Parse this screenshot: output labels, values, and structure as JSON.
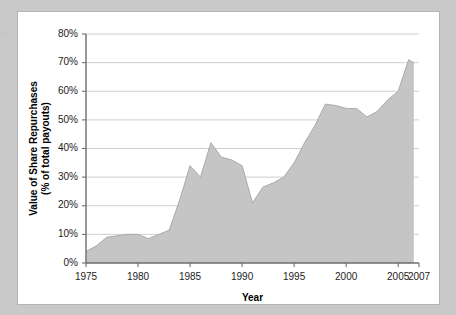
{
  "figure": {
    "background_color": "#c9c9c9",
    "panel_color": "#ffffff",
    "panel_border_color": "#b4b4b4",
    "edge_artifact_text": "s"
  },
  "chart_data": {
    "type": "area",
    "title": "",
    "xlabel": "Year",
    "ylabel": "Value of Share Repurchases\n(% of total payouts)",
    "ylabel_line1": "Value of Share Repurchases",
    "ylabel_line2": "(% of total payouts)",
    "xlim": [
      1975,
      2007
    ],
    "ylim": [
      0,
      80
    ],
    "grid": "horizontal",
    "legend": "none",
    "series_color": "#c5c5c5",
    "series_edge_color": "#a9a9a9",
    "y_tick_labels": [
      "0%",
      "10%",
      "20%",
      "30%",
      "40%",
      "50%",
      "60%",
      "70%",
      "80%"
    ],
    "y_tick_values": [
      0,
      10,
      20,
      30,
      40,
      50,
      60,
      70,
      80
    ],
    "x_tick_labels": [
      "1975",
      "1980",
      "1985",
      "1990",
      "1995",
      "2000",
      "2005",
      "2007"
    ],
    "x_tick_values": [
      1975,
      1980,
      1985,
      1990,
      1995,
      2000,
      2005,
      2007
    ],
    "x": [
      1975,
      1976,
      1977,
      1978,
      1979,
      1980,
      1981,
      1982,
      1983,
      1984,
      1985,
      1986,
      1987,
      1988,
      1989,
      1990,
      1991,
      1992,
      1993,
      1994,
      1995,
      1996,
      1997,
      1998,
      1999,
      2000,
      2001,
      2002,
      2003,
      2004,
      2005,
      2006,
      2006.5
    ],
    "values": [
      4,
      6,
      9,
      9.5,
      10,
      10,
      8.5,
      10,
      11.5,
      22,
      34,
      30,
      42,
      37,
      36,
      34,
      21,
      26.5,
      28,
      30,
      35,
      42,
      48,
      55.5,
      55,
      54,
      54,
      51,
      53,
      57,
      60,
      71,
      70
    ],
    "series": [
      {
        "name": "Value of Share Repurchases (% of total payouts)",
        "values": [
          4,
          6,
          9,
          9.5,
          10,
          10,
          8.5,
          10,
          11.5,
          22,
          34,
          30,
          42,
          37,
          36,
          34,
          21,
          26.5,
          28,
          30,
          35,
          42,
          48,
          55.5,
          55,
          54,
          54,
          51,
          53,
          57,
          60,
          71,
          70
        ]
      }
    ]
  }
}
